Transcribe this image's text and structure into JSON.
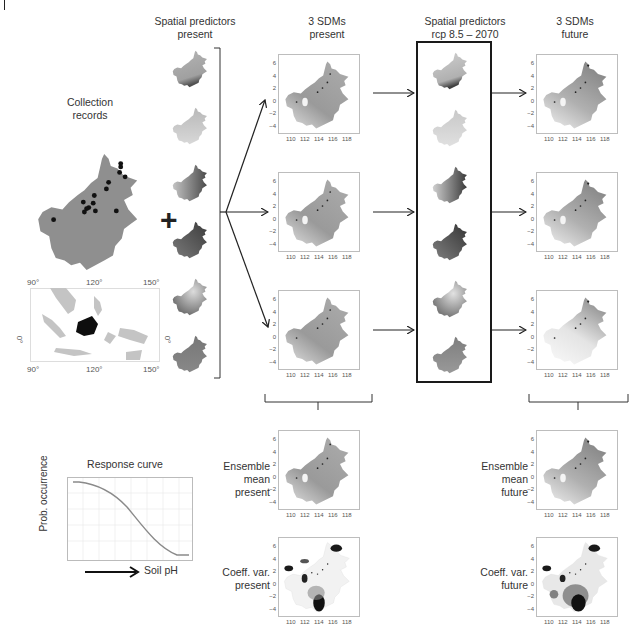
{
  "headers": {
    "spatial_present": [
      "Spatial predictors",
      "present"
    ],
    "sdms_present": [
      "3 SDMs",
      "present"
    ],
    "spatial_future": [
      "Spatial predictors",
      "rcp 8.5 – 2070"
    ],
    "sdms_future": [
      "3 SDMs",
      "future"
    ]
  },
  "collection": {
    "label": [
      "Collection",
      "records"
    ],
    "inset_axis": {
      "x_top": [
        "90°",
        "120°",
        "150°"
      ],
      "x_bottom": [
        "90°",
        "120°",
        "150°"
      ],
      "y_left": "0°",
      "y_right": "0°"
    }
  },
  "plus_symbol": "+",
  "sdm_axes": {
    "x_ticks": [
      "110",
      "112",
      "114",
      "116",
      "118"
    ],
    "y_ticks": [
      "6",
      "4",
      "2",
      "0",
      "−2",
      "−4"
    ]
  },
  "ensemble": {
    "mean_present": [
      "Ensemble",
      "mean",
      "present"
    ],
    "mean_future": [
      "Ensemble",
      "mean",
      "future"
    ],
    "cv_present": [
      "Coeff. var.",
      "present"
    ],
    "cv_future": [
      "Coeff. var.",
      "future"
    ]
  },
  "response_curve": {
    "title": "Response curve",
    "ylabel": "Prob. occurrence",
    "xlabel": "Soil pH"
  },
  "colors": {
    "map_gray": "#8f8f8f",
    "map_light": "#c9c9c9",
    "map_dark": "#555555",
    "frame": "#1a1a1a",
    "curve": "#8a8a8a"
  }
}
